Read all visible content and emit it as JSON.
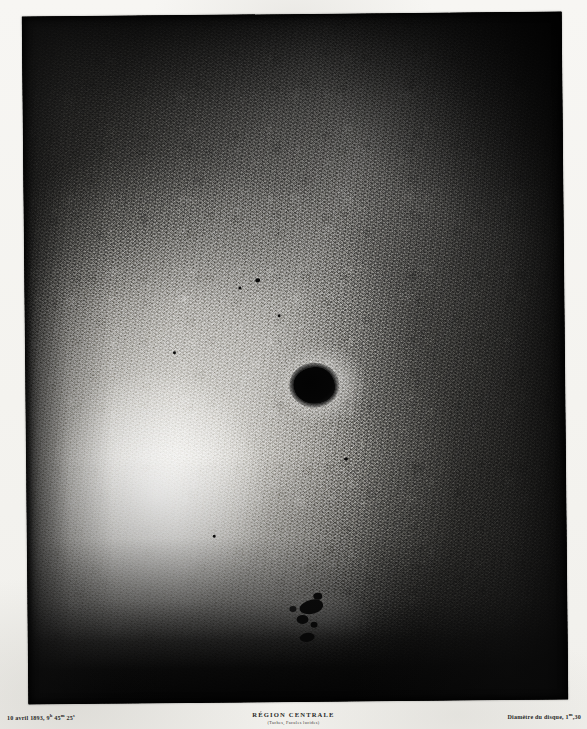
{
  "plate": {
    "kind": "solar-photograph-plate",
    "subject_title": "RÉGION CENTRALE",
    "subject_subtitle": "(Taches, Facules lucides)",
    "observation_date": "10 avril 1893,",
    "observation_time_hours": "9",
    "observation_time_h_unit": "h",
    "observation_time_minutes": " 45",
    "observation_time_m_unit": "m",
    "observation_time_seconds": " 25",
    "observation_time_s_unit": "s",
    "scale_label": "Diamètre du disque, 1",
    "scale_unit": "m",
    "scale_value": ",30",
    "background_color": "#f6f5f2",
    "plate_dark_color": "#1b1b1b",
    "ink_color": "#2a2a28"
  },
  "features": {
    "main_spot_label": "main-sunspot",
    "secondary_group_label": "secondary-sunspot-group",
    "faculae_label": "faculae-bright-region"
  }
}
